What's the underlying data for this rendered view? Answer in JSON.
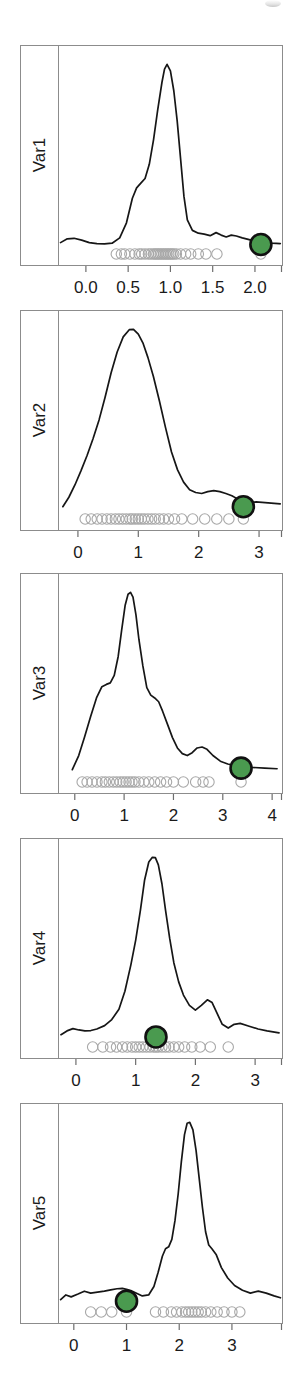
{
  "figure": {
    "title": "",
    "accent_color": "#4a9a4f",
    "highlight_ring_color": "#111111",
    "curve_color": "#161616",
    "rug_color": "#a8a8a8",
    "panel_border_color": "#8c8c8c",
    "background": "#ffffff"
  },
  "chart_data": [
    {
      "type": "line",
      "title": "",
      "panel_label": "Var1",
      "xlabel": "",
      "ylabel": "Var1",
      "xlim": [
        -0.33,
        2.32
      ],
      "ylim": [
        0,
        1.06
      ],
      "grid": false,
      "legend": "none",
      "tick_values": [
        0.0,
        0.5,
        1.0,
        1.5,
        2.0
      ],
      "tick_labels": [
        "0.0",
        "0.5",
        "1.0",
        "1.5",
        "2.0"
      ],
      "x": [
        -0.3,
        -0.22,
        -0.14,
        -0.05,
        0.04,
        0.13,
        0.22,
        0.31,
        0.4,
        0.48,
        0.55,
        0.6,
        0.65,
        0.7,
        0.75,
        0.8,
        0.85,
        0.9,
        0.93,
        0.96,
        1.0,
        1.04,
        1.08,
        1.12,
        1.16,
        1.2,
        1.26,
        1.33,
        1.4,
        1.47,
        1.54,
        1.6,
        1.66,
        1.72,
        1.78,
        1.85,
        1.92,
        2.0,
        2.1,
        2.2,
        2.3
      ],
      "y": [
        0.055,
        0.075,
        0.078,
        0.068,
        0.055,
        0.05,
        0.048,
        0.052,
        0.08,
        0.16,
        0.29,
        0.345,
        0.37,
        0.395,
        0.47,
        0.6,
        0.76,
        0.905,
        0.975,
        1.0,
        0.965,
        0.86,
        0.7,
        0.5,
        0.3,
        0.175,
        0.12,
        0.105,
        0.1,
        0.092,
        0.108,
        0.095,
        0.085,
        0.095,
        0.09,
        0.08,
        0.072,
        0.062,
        0.055,
        0.052,
        0.05
      ],
      "highlight_point": {
        "x": 2.07,
        "y": 0.045,
        "color": "#4a9a4f"
      },
      "rug_values": [
        0.36,
        0.42,
        0.46,
        0.52,
        0.58,
        0.63,
        0.66,
        0.7,
        0.74,
        0.77,
        0.8,
        0.82,
        0.84,
        0.86,
        0.88,
        0.9,
        0.92,
        0.94,
        0.96,
        0.98,
        1.0,
        1.02,
        1.04,
        1.07,
        1.12,
        1.18,
        1.24,
        1.33,
        1.42,
        1.55,
        2.07
      ]
    },
    {
      "type": "line",
      "title": "",
      "panel_label": "Var2",
      "xlabel": "",
      "ylabel": "Var2",
      "xlim": [
        -0.33,
        3.38
      ],
      "ylim": [
        0,
        1.06
      ],
      "grid": false,
      "legend": "none",
      "tick_values": [
        0,
        1,
        2,
        3
      ],
      "tick_labels": [
        "0",
        "1",
        "2",
        "3"
      ],
      "x": [
        -0.25,
        -0.15,
        -0.05,
        0.05,
        0.15,
        0.25,
        0.35,
        0.45,
        0.55,
        0.65,
        0.75,
        0.85,
        0.92,
        1.0,
        1.08,
        1.16,
        1.25,
        1.35,
        1.45,
        1.55,
        1.65,
        1.75,
        1.85,
        1.95,
        2.05,
        2.15,
        2.25,
        2.35,
        2.45,
        2.55,
        2.65,
        2.75,
        2.85,
        2.95,
        3.1,
        3.25,
        3.35
      ],
      "y": [
        0.06,
        0.11,
        0.175,
        0.25,
        0.33,
        0.42,
        0.52,
        0.64,
        0.77,
        0.88,
        0.96,
        0.998,
        1.0,
        0.975,
        0.925,
        0.85,
        0.75,
        0.62,
        0.48,
        0.35,
        0.255,
        0.19,
        0.15,
        0.135,
        0.13,
        0.14,
        0.145,
        0.14,
        0.13,
        0.118,
        0.1,
        0.085,
        0.08,
        0.085,
        0.082,
        0.078,
        0.075
      ],
      "highlight_point": {
        "x": 2.74,
        "y": 0.06,
        "color": "#4a9a4f"
      },
      "rug_values": [
        0.12,
        0.22,
        0.32,
        0.4,
        0.48,
        0.55,
        0.62,
        0.68,
        0.74,
        0.8,
        0.86,
        0.9,
        0.95,
        1.0,
        1.05,
        1.1,
        1.16,
        1.22,
        1.28,
        1.35,
        1.42,
        1.5,
        1.6,
        1.72,
        1.9,
        2.1,
        2.3,
        2.5,
        2.74
      ],
      "xlim_note": "ticks 0,1,2,3"
    },
    {
      "type": "line",
      "title": "",
      "panel_label": "Var3",
      "xlabel": "",
      "ylabel": "Var3",
      "xlim": [
        -0.34,
        4.2
      ],
      "ylim": [
        0,
        1.06
      ],
      "grid": false,
      "legend": "none",
      "tick_values": [
        0,
        1,
        2,
        3,
        4
      ],
      "tick_labels": [
        "0",
        "1",
        "2",
        "3",
        "4"
      ],
      "x": [
        -0.05,
        0.08,
        0.2,
        0.32,
        0.44,
        0.55,
        0.64,
        0.72,
        0.8,
        0.88,
        0.95,
        1.02,
        1.08,
        1.13,
        1.18,
        1.24,
        1.3,
        1.38,
        1.46,
        1.54,
        1.62,
        1.7,
        1.78,
        1.88,
        1.98,
        2.08,
        2.18,
        2.28,
        2.38,
        2.48,
        2.58,
        2.68,
        2.8,
        2.95,
        3.1,
        3.25,
        3.4,
        3.6,
        3.85,
        4.1
      ],
      "y": [
        0.06,
        0.135,
        0.235,
        0.34,
        0.44,
        0.5,
        0.512,
        0.52,
        0.56,
        0.66,
        0.8,
        0.93,
        0.99,
        1.0,
        0.975,
        0.88,
        0.75,
        0.61,
        0.495,
        0.455,
        0.44,
        0.42,
        0.37,
        0.3,
        0.23,
        0.175,
        0.145,
        0.135,
        0.15,
        0.175,
        0.18,
        0.168,
        0.135,
        0.105,
        0.09,
        0.082,
        0.078,
        0.072,
        0.068,
        0.065
      ],
      "highlight_point": {
        "x": 3.37,
        "y": 0.068,
        "color": "#4a9a4f"
      },
      "rug_values": [
        0.15,
        0.25,
        0.35,
        0.45,
        0.55,
        0.62,
        0.7,
        0.78,
        0.85,
        0.92,
        0.98,
        1.04,
        1.1,
        1.16,
        1.22,
        1.3,
        1.4,
        1.5,
        1.62,
        1.74,
        1.86,
        2.0,
        2.2,
        2.45,
        2.6,
        2.72,
        3.37
      ]
    },
    {
      "type": "line",
      "title": "",
      "panel_label": "Var4",
      "xlabel": "",
      "ylabel": "Var4",
      "xlim": [
        -0.3,
        3.45
      ],
      "ylim": [
        0,
        1.06
      ],
      "grid": false,
      "legend": "none",
      "tick_values": [
        0,
        1,
        2,
        3
      ],
      "tick_labels": [
        "0",
        "1",
        "2",
        "3"
      ],
      "x": [
        -0.25,
        -0.15,
        -0.05,
        0.05,
        0.15,
        0.25,
        0.35,
        0.48,
        0.6,
        0.72,
        0.82,
        0.92,
        1.0,
        1.08,
        1.15,
        1.22,
        1.28,
        1.33,
        1.38,
        1.44,
        1.5,
        1.57,
        1.64,
        1.72,
        1.8,
        1.9,
        2.0,
        2.1,
        2.2,
        2.28,
        2.36,
        2.45,
        2.55,
        2.65,
        2.75,
        2.9,
        3.05,
        3.2,
        3.4
      ],
      "y": [
        0.06,
        0.08,
        0.092,
        0.085,
        0.08,
        0.082,
        0.09,
        0.108,
        0.14,
        0.195,
        0.29,
        0.43,
        0.56,
        0.72,
        0.88,
        0.975,
        1.0,
        0.998,
        0.96,
        0.86,
        0.72,
        0.57,
        0.44,
        0.34,
        0.27,
        0.215,
        0.19,
        0.215,
        0.245,
        0.23,
        0.175,
        0.115,
        0.095,
        0.115,
        0.12,
        0.105,
        0.09,
        0.08,
        0.07
      ],
      "highlight_point": {
        "x": 1.34,
        "y": 0.048,
        "color": "#4a9a4f"
      },
      "rug_values": [
        0.28,
        0.45,
        0.58,
        0.68,
        0.78,
        0.86,
        0.94,
        1.0,
        1.06,
        1.12,
        1.18,
        1.24,
        1.3,
        1.34,
        1.38,
        1.44,
        1.5,
        1.56,
        1.64,
        1.72,
        1.82,
        1.94,
        2.08,
        2.25,
        2.55
      ]
    },
    {
      "type": "line",
      "title": "",
      "panel_label": "Var5",
      "xlabel": "",
      "ylabel": "Var5",
      "xlim": [
        -0.3,
        3.95
      ],
      "ylim": [
        0,
        1.06
      ],
      "grid": false,
      "legend": "none",
      "tick_values": [
        0,
        1,
        2,
        3
      ],
      "tick_labels": [
        "0",
        "1",
        "2",
        "3"
      ],
      "x": [
        -0.25,
        -0.15,
        -0.05,
        0.08,
        0.2,
        0.32,
        0.45,
        0.58,
        0.7,
        0.82,
        0.92,
        1.0,
        1.08,
        1.18,
        1.3,
        1.42,
        1.52,
        1.6,
        1.68,
        1.74,
        1.8,
        1.86,
        1.92,
        1.98,
        2.04,
        2.1,
        2.15,
        2.2,
        2.26,
        2.32,
        2.38,
        2.44,
        2.5,
        2.56,
        2.62,
        2.7,
        2.8,
        2.92,
        3.05,
        3.2,
        3.35,
        3.5,
        3.65,
        3.8,
        3.92
      ],
      "y": [
        0.06,
        0.085,
        0.075,
        0.09,
        0.105,
        0.095,
        0.1,
        0.105,
        0.112,
        0.118,
        0.12,
        0.115,
        0.108,
        0.095,
        0.08,
        0.085,
        0.13,
        0.205,
        0.29,
        0.33,
        0.34,
        0.38,
        0.48,
        0.62,
        0.79,
        0.935,
        0.995,
        1.0,
        0.96,
        0.85,
        0.7,
        0.55,
        0.42,
        0.35,
        0.33,
        0.3,
        0.23,
        0.175,
        0.135,
        0.11,
        0.095,
        0.105,
        0.095,
        0.08,
        0.07
      ],
      "highlight_point": {
        "x": 1.0,
        "y": 0.052,
        "color": "#4a9a4f"
      },
      "rug_values": [
        0.32,
        0.52,
        0.72,
        1.0,
        1.55,
        1.7,
        1.85,
        1.95,
        2.05,
        2.12,
        2.18,
        2.24,
        2.3,
        2.36,
        2.42,
        2.5,
        2.6,
        2.72,
        2.85,
        3.0,
        3.15
      ]
    }
  ]
}
